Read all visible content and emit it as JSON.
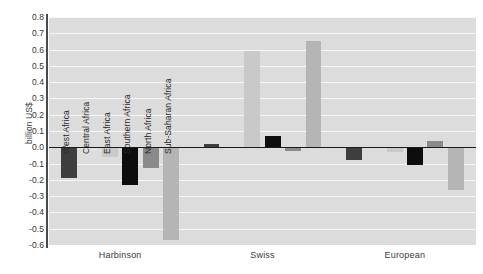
{
  "chart_data": {
    "type": "bar",
    "title": "",
    "xlabel": "",
    "ylabel": "billion US$",
    "ylim": [
      -0.6,
      0.8
    ],
    "ytick_step": 0.1,
    "grid": true,
    "legend": "none",
    "group_labels": [
      "Harbinson",
      "Swiss",
      "European"
    ],
    "categories": [
      "West Africa",
      "Central Africa",
      "East Africa",
      "Southern Africa",
      "North Africa",
      "Sub-Saharan Africa"
    ],
    "yticks": [
      "0.8",
      "0.7",
      "0.6",
      "0.5",
      "0.4",
      "0.3",
      "0.2",
      "0.1",
      "0.0",
      "-0.1",
      "-0.2",
      "-0.3",
      "-0.4",
      "-0.5",
      "-0.6"
    ],
    "series": [
      {
        "name": "Harbinson",
        "values": [
          -0.19,
          -0.02,
          -0.06,
          -0.23,
          -0.13,
          -0.57
        ]
      },
      {
        "name": "Swiss",
        "values": [
          0.02,
          -0.015,
          0.59,
          0.07,
          -0.02,
          0.655
        ]
      },
      {
        "name": "European",
        "values": [
          -0.08,
          -0.005,
          -0.03,
          -0.11,
          0.04,
          -0.265
        ]
      }
    ],
    "bar_colors": [
      "#3e3e3e",
      "#e2e2e2",
      "#c9c9c9",
      "#0d0d0d",
      "#8a8a8a",
      "#b5b5b5"
    ],
    "plot_background": "#dcdcdc",
    "gridline_color": "#f7f7f7",
    "axis_color": "#1a1a1a"
  }
}
